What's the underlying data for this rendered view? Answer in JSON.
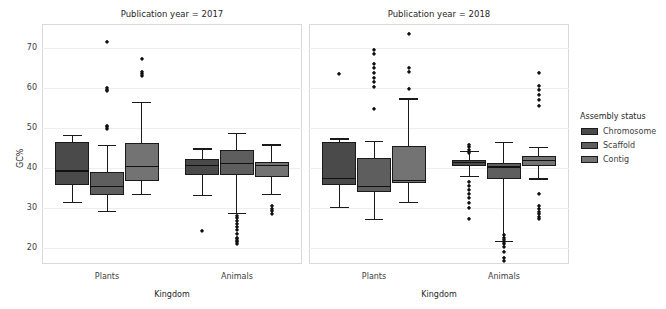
{
  "chart_data": {
    "type": "box",
    "title": "",
    "xlabel": "Kingdom",
    "ylabel": "GC%",
    "ylim": [
      16,
      76
    ],
    "yticks": [
      20,
      30,
      40,
      50,
      60,
      70
    ],
    "ytick_labels": [
      "20",
      "30",
      "40",
      "50",
      "60",
      "70"
    ],
    "categories": [
      "Plants",
      "Animals"
    ],
    "grid": "horizontal",
    "legend": {
      "title": "Assembly status",
      "position": "right",
      "entries": [
        {
          "label": "Chromosome",
          "color": "#4a4a4a"
        },
        {
          "label": "Scaffold",
          "color": "#5e5e5e"
        },
        {
          "label": "Contig",
          "color": "#737373"
        }
      ]
    },
    "facets": [
      {
        "title": "Publication year = 2017",
        "groups": [
          {
            "category": "Plants",
            "boxes": [
              {
                "status": "Chromosome",
                "whislo": 31.5,
                "q1": 35.8,
                "med": 39.4,
                "q3": 46.6,
                "whishi": 48.3,
                "fliers": []
              },
              {
                "status": "Scaffold",
                "whislo": 29.2,
                "q1": 33.2,
                "med": 35.6,
                "q3": 38.9,
                "whishi": 45.7,
                "fliers": [
                  49.8,
                  50.2,
                  50.4,
                  59.2,
                  59.6,
                  60.0,
                  71.4
                ]
              },
              {
                "status": "Contig",
                "whislo": 33.5,
                "q1": 36.7,
                "med": 40.6,
                "q3": 46.3,
                "whishi": 56.6,
                "fliers": [
                  63.0,
                  63.5,
                  64.0,
                  67.2
                ]
              }
            ]
          },
          {
            "category": "Animals",
            "boxes": [
              {
                "status": "Chromosome",
                "whislo": 33.2,
                "q1": 38.3,
                "med": 40.8,
                "q3": 42.2,
                "whishi": 44.9,
                "fliers": [
                  24.2
                ]
              },
              {
                "status": "Scaffold",
                "whislo": 28.8,
                "q1": 38.3,
                "med": 41.2,
                "q3": 44.4,
                "whishi": 48.7,
                "fliers": [
                  21.0,
                  21.4,
                  21.8,
                  22.2,
                  22.6,
                  23.4,
                  24.4,
                  25.2,
                  26.0,
                  26.8,
                  27.4,
                  28.0
                ]
              },
              {
                "status": "Contig",
                "whislo": 33.6,
                "q1": 37.8,
                "med": 40.8,
                "q3": 41.5,
                "whishi": 45.9,
                "fliers": [
                  28.6,
                  29.2,
                  29.8,
                  30.4
                ]
              }
            ]
          }
        ]
      },
      {
        "title": "Publication year = 2018",
        "groups": [
          {
            "category": "Plants",
            "boxes": [
              {
                "status": "Chromosome",
                "whislo": 30.2,
                "q1": 35.8,
                "med": 37.5,
                "q3": 46.4,
                "whishi": 47.4,
                "fliers": [
                  63.6
                ]
              },
              {
                "status": "Scaffold",
                "whislo": 27.2,
                "q1": 33.9,
                "med": 35.5,
                "q3": 42.5,
                "whishi": 46.8,
                "fliers": [
                  54.8,
                  60.2,
                  61.4,
                  62.6,
                  63.8,
                  65.0,
                  66.0,
                  68.6,
                  69.4
                ]
              },
              {
                "status": "Contig",
                "whislo": 31.5,
                "q1": 36.2,
                "med": 37.0,
                "q3": 45.4,
                "whishi": 57.4,
                "fliers": [
                  59.8,
                  64.0,
                  65.0,
                  73.4
                ]
              }
            ]
          },
          {
            "category": "Animals",
            "boxes": [
              {
                "status": "Chromosome",
                "whislo": 38.0,
                "q1": 40.6,
                "med": 41.5,
                "q3": 42.0,
                "whishi": 44.2,
                "fliers": [
                  27.2,
                  30.0,
                  31.2,
                  32.4,
                  33.4,
                  34.6,
                  35.6,
                  36.4,
                  43.8,
                  44.6,
                  45.2,
                  45.8
                ]
              },
              {
                "status": "Scaffold",
                "whislo": 21.8,
                "q1": 37.2,
                "med": 40.4,
                "q3": 41.2,
                "whishi": 46.6,
                "fliers": [
                  16.8,
                  17.4,
                  19.0,
                  20.2,
                  21.0,
                  21.4,
                  22.0,
                  22.6,
                  23.2
                ]
              },
              {
                "status": "Contig",
                "whislo": 37.4,
                "q1": 40.6,
                "med": 42.0,
                "q3": 43.0,
                "whishi": 45.2,
                "fliers": [
                  27.2,
                  27.8,
                  28.4,
                  29.0,
                  29.8,
                  30.6,
                  33.6,
                  55.6,
                  57.0,
                  58.2,
                  59.4,
                  60.4,
                  63.8
                ]
              }
            ]
          }
        ]
      }
    ]
  }
}
